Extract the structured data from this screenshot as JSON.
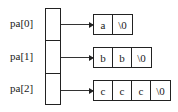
{
  "pointers": [
    {
      "label": "pa[0]",
      "string": [
        "a",
        "\\0"
      ]
    },
    {
      "label": "pa[1]",
      "string": [
        "b",
        "b",
        "\\0"
      ]
    },
    {
      "label": "pa[2]",
      "string": [
        "c",
        "c",
        "c",
        "\\0"
      ]
    }
  ]
}
